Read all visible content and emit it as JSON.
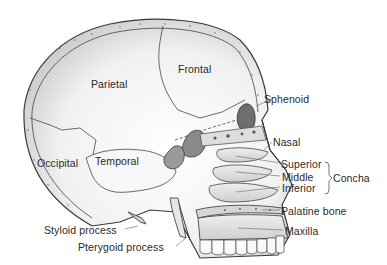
{
  "diagram": {
    "type": "anatomical illustration",
    "labels": {
      "parietal": "Parietal",
      "frontal": "Frontal",
      "sphenoid": "Sphenoid",
      "nasal": "Nasal",
      "occipital": "Occipital",
      "temporal": "Temporal",
      "superior": "Superior",
      "middle": "Middle",
      "inferior": "Inferior",
      "concha": "Concha",
      "palatine_bone": "Palatine bone",
      "maxilla": "Maxilla",
      "styloid_process": "Styloid process",
      "pterygoid_process": "Pterygoid process"
    },
    "groups": [
      {
        "name": "Concha",
        "members": [
          "Superior",
          "Middle",
          "Inferior"
        ]
      }
    ]
  }
}
